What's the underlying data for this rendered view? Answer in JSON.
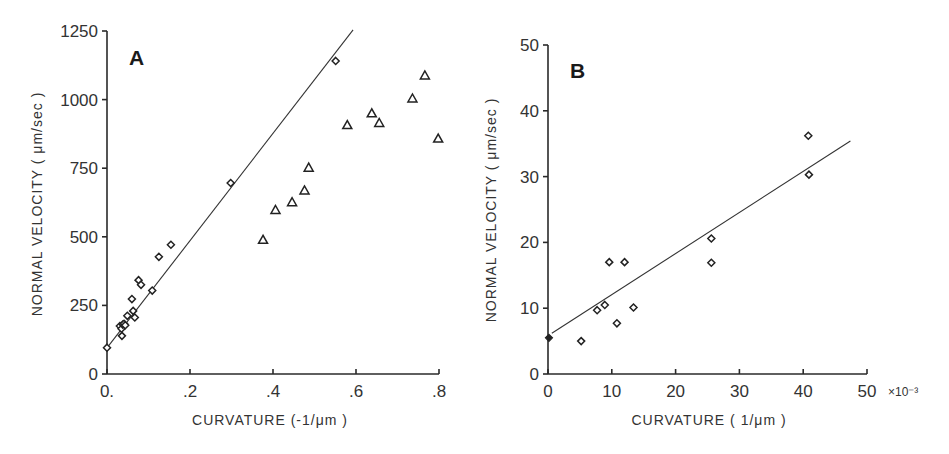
{
  "chart_data": [
    {
      "id": "A",
      "panel_label": "A",
      "type": "scatter",
      "xlabel": "CURVATURE (-1/μm )",
      "ylabel": "NORMAL VELOCITY ( μm/sec )",
      "xlim": [
        0,
        0.8
      ],
      "ylim": [
        0,
        1250
      ],
      "xticks": [
        0,
        0.2,
        0.4,
        0.6,
        0.8
      ],
      "xtick_labels": [
        "0.",
        ".2",
        ".4",
        ".6",
        ".8"
      ],
      "yticks": [
        0,
        250,
        500,
        750,
        1000,
        1250
      ],
      "ytick_labels": [
        "0",
        "250",
        "500",
        "750",
        "1000",
        "1250"
      ],
      "grid": false,
      "legend": null,
      "series": [
        {
          "name": "diamonds",
          "marker": "diamond",
          "points": [
            [
              0.0,
              96
            ],
            [
              0.031,
              175
            ],
            [
              0.035,
              165
            ],
            [
              0.036,
              139
            ],
            [
              0.038,
              180
            ],
            [
              0.041,
              183
            ],
            [
              0.044,
              178
            ],
            [
              0.049,
              212
            ],
            [
              0.06,
              273
            ],
            [
              0.063,
              230
            ],
            [
              0.067,
              206
            ],
            [
              0.076,
              342
            ],
            [
              0.082,
              325
            ],
            [
              0.109,
              304
            ],
            [
              0.125,
              427
            ],
            [
              0.154,
              471
            ],
            [
              0.298,
              696
            ],
            [
              0.551,
              1141
            ]
          ]
        },
        {
          "name": "triangles",
          "marker": "triangle",
          "points": [
            [
              0.376,
              489
            ],
            [
              0.406,
              598
            ],
            [
              0.446,
              626
            ],
            [
              0.476,
              669
            ],
            [
              0.486,
              752
            ],
            [
              0.579,
              907
            ],
            [
              0.638,
              950
            ],
            [
              0.656,
              915
            ],
            [
              0.736,
              1004
            ],
            [
              0.766,
              1088
            ],
            [
              0.798,
              858
            ]
          ]
        }
      ],
      "fit_line": {
        "x0": 0.0,
        "y0": 95,
        "x1": 0.593,
        "y1": 1254
      }
    },
    {
      "id": "B",
      "panel_label": "B",
      "type": "scatter",
      "xlabel": "CURVATURE ( 1/μm )",
      "ylabel": "NORMAL VELOCITY ( μm/sec )",
      "x_multiplier_label": "×10⁻³",
      "xlim": [
        0,
        50
      ],
      "ylim": [
        0,
        50
      ],
      "xticks": [
        0,
        10,
        20,
        30,
        40,
        50
      ],
      "xtick_labels": [
        "0",
        "10",
        "20",
        "30",
        "40",
        "50"
      ],
      "yticks": [
        0,
        10,
        20,
        30,
        40,
        50
      ],
      "ytick_labels": [
        "0",
        "10",
        "20",
        "30",
        "40",
        "50"
      ],
      "grid": false,
      "legend": null,
      "series": [
        {
          "name": "filled-origin",
          "marker": "diamond-filled",
          "points": [
            [
              0.15,
              5.5
            ]
          ]
        },
        {
          "name": "diamonds",
          "marker": "diamond",
          "points": [
            [
              5.2,
              5.0
            ],
            [
              7.7,
              9.7
            ],
            [
              8.9,
              10.5
            ],
            [
              9.6,
              17.0
            ],
            [
              10.8,
              7.7
            ],
            [
              12.0,
              17.0
            ],
            [
              13.4,
              10.1
            ],
            [
              25.6,
              20.6
            ],
            [
              25.6,
              16.9
            ],
            [
              40.8,
              36.2
            ],
            [
              40.9,
              30.3
            ]
          ]
        }
      ],
      "fit_line": {
        "x0": 0.6,
        "y0": 6.2,
        "x1": 47.4,
        "y1": 35.4
      }
    }
  ],
  "layout": {
    "A": {
      "x0px": 107,
      "x1px": 439,
      "y0px": 374,
      "y1px": 31,
      "ylabel_x": 42,
      "ylabel_y": 204,
      "xlabel_x": 270,
      "xlabel_y": 425,
      "panel_x": 129,
      "panel_y": 65
    },
    "B": {
      "x0px": 548,
      "x1px": 867,
      "y0px": 374,
      "y1px": 45,
      "ylabel_x": 496,
      "ylabel_y": 210,
      "xlabel_x": 709,
      "xlabel_y": 425,
      "panel_x": 570,
      "panel_y": 78,
      "mult_x": 888,
      "mult_y": 396
    }
  }
}
